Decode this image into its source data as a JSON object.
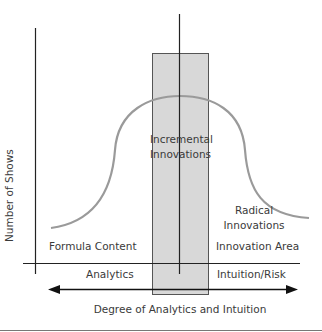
{
  "diagram": {
    "y_axis_label": "Number of Shows",
    "x_axis_title": "Degree of Analytics and Intuition",
    "left_axis_label": "Analytics",
    "right_axis_label": "Intuition/Risk",
    "regions": {
      "left": "Formula Content",
      "center_line1": "Incremental",
      "center_line2": "Innovations",
      "right_line1": "Radical",
      "right_line2": "Innovations",
      "right_area": "Innovation Area"
    },
    "colors": {
      "axis": "#222222",
      "curve": "#9a9a9a",
      "band_fill": "#d6d6d6",
      "band_stroke": "#555555",
      "text": "#3a3a3a"
    }
  }
}
